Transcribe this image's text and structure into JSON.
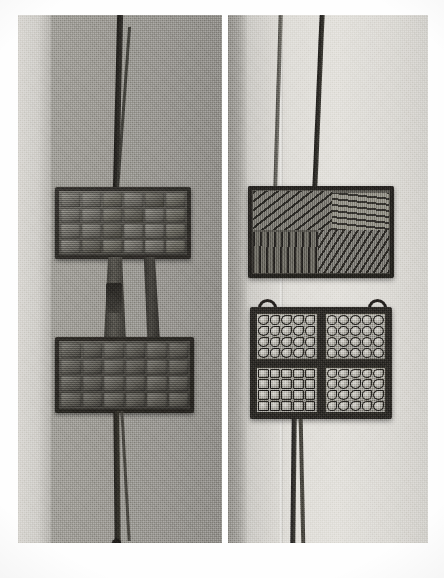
{
  "figure": {
    "kind": "halftone-photograph-plate",
    "panel_count": 2,
    "background_color": "#ffffff",
    "caption": ""
  },
  "panels": [
    {
      "id": "left",
      "name": "left-photograph",
      "subject": "wafer-iron shown open, both hinged plates with rectangular waffle cells",
      "background_tone": "#9b9993",
      "objects": [
        {
          "name": "upper-iron-plate",
          "cell_grid": {
            "columns": 6,
            "rows": 4
          },
          "finish": "dark-cast-iron"
        },
        {
          "name": "lower-iron-plate",
          "cell_grid": {
            "columns": 6,
            "rows": 4
          },
          "finish": "dark-cast-iron-worn"
        },
        {
          "name": "upper-handle-rod-pair",
          "count": 2
        },
        {
          "name": "hinge-neck",
          "count": 2
        },
        {
          "name": "lower-handle-rod-pair",
          "count": 2
        },
        {
          "name": "handle-end-knob",
          "count": 1
        }
      ]
    },
    {
      "id": "right",
      "name": "right-photograph",
      "subject": "second wafer-iron, engraved hatched face above and four-quadrant ring-stamped plate below",
      "background_tone": "#dedcd7",
      "objects": [
        {
          "name": "upper-engraved-plate",
          "decoration": "diagonal and vertical incised hatching in four zones"
        },
        {
          "name": "lower-quadrant-plate",
          "quadrants": 4,
          "cell_grid_per_quadrant": {
            "columns": 5,
            "rows": 4
          },
          "motif": "small ring / crescent stamps"
        },
        {
          "name": "hanging-hook",
          "count": 2
        },
        {
          "name": "upper-handle-rod-pair",
          "count": 2
        },
        {
          "name": "lower-handle-rod-pair",
          "count": 2
        }
      ]
    }
  ],
  "colors": {
    "paper": "#ffffff",
    "left_ground": "#9b9993",
    "left_pale_band": "#d4d2cd",
    "right_ground": "#dedcd7",
    "right_dark_edge": "#9a9893",
    "iron_dark": "#3a3833",
    "iron_mid": "#6d6b65",
    "iron_light": "#b9b7b0"
  }
}
